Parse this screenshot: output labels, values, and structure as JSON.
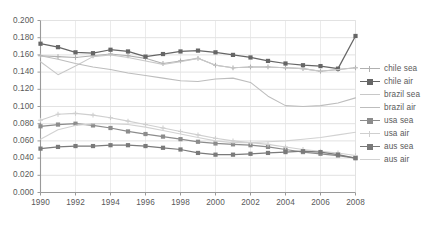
{
  "chart_data": {
    "type": "line",
    "title": "",
    "xlabel": "",
    "ylabel": "",
    "xlim": [
      1990,
      2008
    ],
    "ylim": [
      0.0,
      0.2
    ],
    "grid": true,
    "legend_position": "right",
    "x": [
      1990,
      1991,
      1992,
      1993,
      1994,
      1995,
      1996,
      1997,
      1998,
      1999,
      2000,
      2001,
      2002,
      2003,
      2004,
      2005,
      2006,
      2007,
      2008
    ],
    "ytick_labels": [
      "0.200",
      "0.180",
      "0.160",
      "0.140",
      "0.120",
      "0.100",
      "0.080",
      "0.060",
      "0.040",
      "0.020",
      "0.000"
    ],
    "ytick_values": [
      0.2,
      0.18,
      0.16,
      0.14,
      0.12,
      0.1,
      0.08,
      0.06,
      0.04,
      0.02,
      0.0
    ],
    "xtick_labels": [
      "1990",
      "1992",
      "1994",
      "1996",
      "1998",
      "2000",
      "2002",
      "2004",
      "2006",
      "2008"
    ],
    "xtick_values": [
      1990,
      1992,
      1994,
      1996,
      1998,
      2000,
      2002,
      2004,
      2006,
      2008
    ],
    "series": [
      {
        "name": "chile sea",
        "color": "#b0b0b0",
        "marker": "plus",
        "values": [
          0.159,
          0.158,
          0.157,
          0.159,
          0.161,
          0.159,
          0.156,
          0.15,
          0.153,
          0.156,
          0.148,
          0.145,
          0.146,
          0.146,
          0.145,
          0.144,
          0.141,
          0.143,
          0.145
        ]
      },
      {
        "name": "chile air",
        "color": "#666666",
        "marker": "square",
        "values": [
          0.173,
          0.169,
          0.163,
          0.162,
          0.166,
          0.164,
          0.158,
          0.161,
          0.164,
          0.165,
          0.163,
          0.16,
          0.157,
          0.153,
          0.15,
          0.148,
          0.147,
          0.144,
          0.182
        ]
      },
      {
        "name": "brazil sea",
        "color": "#c8c8c8",
        "marker": "none",
        "values": [
          0.152,
          0.137,
          0.147,
          0.158,
          0.16,
          0.157,
          0.153,
          0.149,
          0.152,
          0.156,
          0.148,
          0.145,
          0.146,
          0.146,
          0.145,
          0.144,
          0.141,
          0.143,
          0.145
        ]
      },
      {
        "name": "brazil air",
        "color": "#bdbdbd",
        "marker": "none",
        "values": [
          0.159,
          0.155,
          0.15,
          0.146,
          0.143,
          0.139,
          0.136,
          0.133,
          0.13,
          0.129,
          0.132,
          0.133,
          0.128,
          0.112,
          0.101,
          0.1,
          0.101,
          0.104,
          0.11
        ]
      },
      {
        "name": "usa sea",
        "color": "#8c8c8c",
        "marker": "square",
        "values": [
          0.077,
          0.079,
          0.08,
          0.078,
          0.075,
          0.071,
          0.068,
          0.065,
          0.062,
          0.059,
          0.057,
          0.056,
          0.055,
          0.053,
          0.05,
          0.047,
          0.045,
          0.043,
          0.04
        ]
      },
      {
        "name": "usa air",
        "color": "#cfcfcf",
        "marker": "plus",
        "values": [
          0.084,
          0.091,
          0.092,
          0.09,
          0.087,
          0.083,
          0.079,
          0.075,
          0.071,
          0.067,
          0.063,
          0.06,
          0.058,
          0.056,
          0.053,
          0.05,
          0.048,
          0.046,
          0.043
        ]
      },
      {
        "name": "aus sea",
        "color": "#7a7a7a",
        "marker": "square",
        "values": [
          0.051,
          0.053,
          0.054,
          0.054,
          0.055,
          0.055,
          0.054,
          0.052,
          0.05,
          0.046,
          0.044,
          0.044,
          0.045,
          0.046,
          0.047,
          0.048,
          0.047,
          0.044,
          0.04
        ]
      },
      {
        "name": "aus air",
        "color": "#d2d2d2",
        "marker": "none",
        "values": [
          0.062,
          0.073,
          0.078,
          0.08,
          0.08,
          0.079,
          0.076,
          0.072,
          0.068,
          0.064,
          0.06,
          0.058,
          0.058,
          0.059,
          0.06,
          0.062,
          0.064,
          0.067,
          0.07
        ]
      }
    ]
  },
  "plot": {
    "axis_color": "#9a9a9a",
    "grid_color": "#e2e2e2",
    "background": "#ffffff"
  }
}
